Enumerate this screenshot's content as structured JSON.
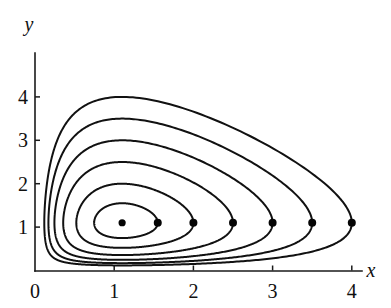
{
  "chart_data": {
    "type": "line",
    "title": "",
    "subtitle": "",
    "xlabel": "x",
    "ylabel": "y",
    "xlim": [
      0,
      4.35
    ],
    "ylim": [
      0,
      4.9
    ],
    "grid": false,
    "legend": null,
    "annotations": [],
    "xticks": [
      {
        "value": 0,
        "label": "0"
      },
      {
        "value": 1,
        "label": "1"
      },
      {
        "value": 2,
        "label": "2"
      },
      {
        "value": 3,
        "label": "3"
      },
      {
        "value": 4,
        "label": "4"
      }
    ],
    "yticks": [
      {
        "value": 1,
        "label": "1"
      },
      {
        "value": 2,
        "label": "2"
      },
      {
        "value": 3,
        "label": "3"
      },
      {
        "value": 4,
        "label": "4"
      }
    ],
    "equilibrium": {
      "x": 1.1,
      "y": 1.1
    },
    "model": {
      "a": 1.0,
      "b": 0.909,
      "c": 1.0,
      "d": 0.909
    },
    "markers": [
      {
        "x": 1.1,
        "y": 1.1,
        "label": ""
      },
      {
        "x": 1.55,
        "y": 1.1,
        "label": ""
      },
      {
        "x": 2.0,
        "y": 1.1,
        "label": ""
      },
      {
        "x": 2.5,
        "y": 1.1,
        "label": ""
      },
      {
        "x": 3.0,
        "y": 1.1,
        "label": ""
      },
      {
        "x": 3.5,
        "y": 1.1,
        "label": ""
      },
      {
        "x": 4.0,
        "y": 1.1,
        "label": ""
      }
    ],
    "series": [
      {
        "name": "orbit-1",
        "start_x": 1.55,
        "start_y": 1.1,
        "peak_y": 1.68,
        "min_y": 0.62,
        "x_min": 0.7,
        "x_max": 1.56
      },
      {
        "name": "orbit-2",
        "start_x": 2.0,
        "start_y": 1.1,
        "peak_y": 2.26,
        "min_y": 0.4,
        "x_min": 0.46,
        "x_max": 2.01
      },
      {
        "name": "orbit-3",
        "start_x": 2.5,
        "start_y": 1.1,
        "peak_y": 2.78,
        "min_y": 0.26,
        "x_min": 0.31,
        "x_max": 2.51
      },
      {
        "name": "orbit-4",
        "start_x": 3.0,
        "start_y": 1.1,
        "peak_y": 3.38,
        "min_y": 0.16,
        "x_min": 0.21,
        "x_max": 3.01
      },
      {
        "name": "orbit-5",
        "start_x": 3.5,
        "start_y": 1.1,
        "peak_y": 4.0,
        "min_y": 0.1,
        "x_min": 0.14,
        "x_max": 3.51
      },
      {
        "name": "orbit-6",
        "start_x": 4.0,
        "start_y": 1.1,
        "peak_y": 4.52,
        "min_y": 0.06,
        "x_min": 0.09,
        "x_max": 4.01
      }
    ]
  },
  "axes": {
    "x_label": "x",
    "y_label": "y"
  }
}
